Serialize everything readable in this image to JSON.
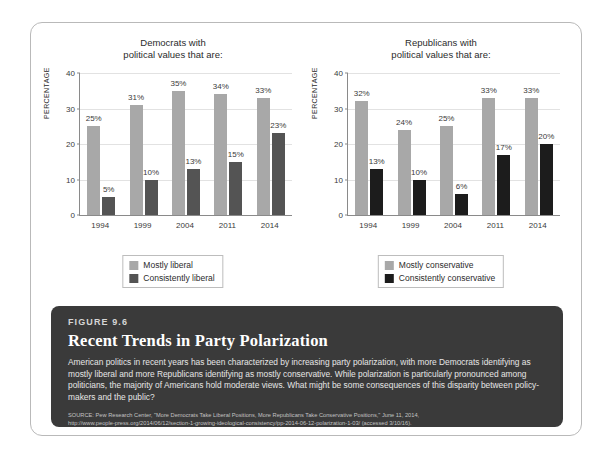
{
  "figure": {
    "number_label": "FIGURE 9.6",
    "title": "Recent Trends in Party Polarization",
    "body": "American politics in recent years has been characterized by increasing party polarization, with more Democrats identifying as mostly liberal and more Republicans identifying as mostly conservative. While polarization is particularly pronounced among politicians, the majority of Americans hold moderate views. What might be some consequences of this disparity between policy-makers and the public?",
    "source_line1": "SOURCE: Pew Research Center, \"More Democrats Take Liberal Positions, More Republicans Take Conservative Positions,\" June 11, 2014,",
    "source_line2": "http://www.people-press.org/2014/06/12/section-1-growing-ideological-consistency/pp-2014-06-12-polarization-1-03/ (accessed 3/10/16)."
  },
  "colors": {
    "light_gray_bar": "#a8a8a8",
    "dark_gray_bar": "#545454",
    "near_black_bar": "#1c1c1c",
    "axis": "#8a8a8a",
    "grid": "#e2e2e2",
    "caption_bg": "#3a3a3a",
    "card_border": "#b9b9b9"
  },
  "chart_data": [
    {
      "type": "bar",
      "title": "Democrats with\npolitical values that are:",
      "title_line1": "Democrats with",
      "title_line2": "political values that are:",
      "xlabel": "",
      "ylabel": "PERCENTAGE",
      "ylim": [
        0,
        40
      ],
      "yticks": [
        0,
        10,
        20,
        30,
        40
      ],
      "grid": true,
      "legend_position": "bottom",
      "categories": [
        "1994",
        "1999",
        "2004",
        "2011",
        "2014"
      ],
      "series": [
        {
          "name": "Mostly liberal",
          "color": "#a8a8a8",
          "values": [
            25,
            31,
            35,
            34,
            33
          ],
          "labels": [
            "25%",
            "31%",
            "35%",
            "34%",
            "33%"
          ]
        },
        {
          "name": "Consistently liberal",
          "color": "#545454",
          "values": [
            5,
            10,
            13,
            15,
            23
          ],
          "labels": [
            "5%",
            "10%",
            "13%",
            "15%",
            "23%"
          ]
        }
      ]
    },
    {
      "type": "bar",
      "title": "Republicans with\npolitical values that are:",
      "title_line1": "Republicans with",
      "title_line2": "political values that are:",
      "xlabel": "",
      "ylabel": "PERCENTAGE",
      "ylim": [
        0,
        40
      ],
      "yticks": [
        0,
        10,
        20,
        30,
        40
      ],
      "grid": true,
      "legend_position": "bottom",
      "categories": [
        "1994",
        "1999",
        "2004",
        "2011",
        "2014"
      ],
      "series": [
        {
          "name": "Mostly conservative",
          "color": "#a8a8a8",
          "values": [
            32,
            24,
            25,
            33,
            33
          ],
          "labels": [
            "32%",
            "24%",
            "25%",
            "33%",
            "33%"
          ]
        },
        {
          "name": "Consistently conservative",
          "color": "#1c1c1c",
          "values": [
            13,
            10,
            6,
            17,
            20
          ],
          "labels": [
            "13%",
            "10%",
            "6%",
            "17%",
            "20%"
          ]
        }
      ]
    }
  ]
}
